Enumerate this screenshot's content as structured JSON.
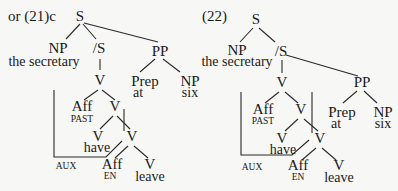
{
  "tree_21c": {
    "example_label": "or  (21)c",
    "S": "S",
    "NP": "NP",
    "NP_word": "the secretary",
    "S_bar": "/S",
    "PP": "PP",
    "V_top": "V",
    "Prep": "Prep",
    "Prep_word": "at",
    "NP2": "NP",
    "NP2_word": "six",
    "Aff_past": "Aff",
    "Aff_past_sub": "PAST",
    "V_mid": "V",
    "V_have": "V",
    "have_word": "have",
    "V_low": "V",
    "AUX": "AUX",
    "Aff_en": "Aff",
    "Aff_en_sub": "EN",
    "V_leave": "V",
    "leave_word": "leave"
  },
  "tree_22": {
    "example_label": "(22)",
    "S": "S",
    "NP": "NP",
    "NP_word": "the secretary",
    "S_bar": "/S",
    "V_top": "V",
    "PP": "PP",
    "Prep": "Prep",
    "Prep_word": "at",
    "NP2": "NP",
    "NP2_word": "six",
    "Aff_past": "Aff",
    "Aff_past_sub": "PAST",
    "V_mid": "V",
    "V_have": "V",
    "have_word": "have",
    "V_low": "V",
    "AUX": "AUX",
    "Aff_en": "Aff",
    "Aff_en_sub": "EN",
    "V_leave": "V",
    "leave_word": "leave"
  }
}
